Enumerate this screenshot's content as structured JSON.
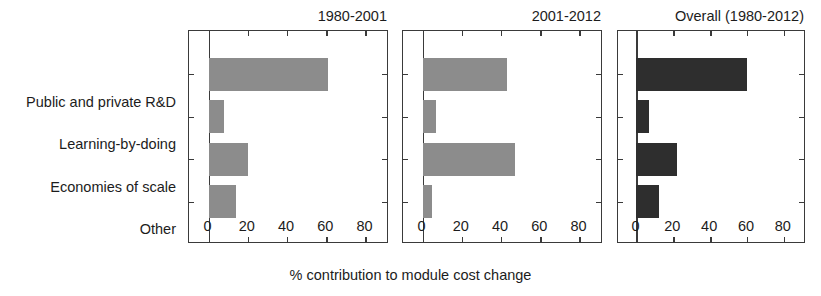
{
  "chart_data": {
    "type": "bar",
    "title": "",
    "orientation": "horizontal",
    "xlabel": "% contribution to module cost change",
    "ylabel": "",
    "xlim": [
      -10,
      92
    ],
    "xticks": [
      0,
      20,
      40,
      60,
      80
    ],
    "xticklabels": [
      "0",
      "20",
      "40",
      "60",
      "80"
    ],
    "grid": false,
    "legend": "none",
    "categories": [
      "Public and private R&D",
      "Learning-by-doing",
      "Economies of scale",
      "Other"
    ],
    "panels": [
      {
        "title": "1980-2001",
        "bar_color": "#8c8c8c",
        "values": [
          61,
          8,
          20,
          14
        ]
      },
      {
        "title": "2001-2012",
        "bar_color": "#8c8c8c",
        "values": [
          43,
          7,
          47,
          5
        ]
      },
      {
        "title": "Overall (1980-2012)",
        "bar_color": "#2e2e2e",
        "values": [
          60,
          7,
          22,
          12
        ]
      }
    ]
  },
  "axis": {
    "frame_color": "#3a3a3a",
    "background": "#ffffff"
  }
}
